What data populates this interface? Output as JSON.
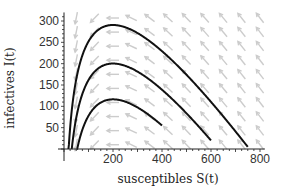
{
  "chart_data": {
    "type": "line",
    "title": "",
    "xlabel": "susceptibles S(t)",
    "ylabel": "infectives I(t)",
    "xlim": [
      0,
      820
    ],
    "ylim": [
      0,
      320
    ],
    "xticks": [
      200,
      400,
      600,
      800
    ],
    "yticks": [
      50,
      100,
      150,
      200,
      250,
      300
    ],
    "xtick_labels": [
      "200",
      "400",
      "600",
      "800"
    ],
    "ytick_labels": [
      "50",
      "100",
      "150",
      "200",
      "250",
      "300"
    ],
    "grid": false,
    "legend": "none",
    "model": {
      "rho": 200
    },
    "series": [
      {
        "name": "trajectory-1",
        "S0": 750,
        "I0": 5,
        "peak": {
          "S": 200,
          "I": 291
        }
      },
      {
        "name": "trajectory-2",
        "S0": 600,
        "I0": 20,
        "peak": {
          "S": 200,
          "I": 200
        }
      },
      {
        "name": "trajectory-3",
        "S0": 400,
        "I0": 55,
        "peak": {
          "S": 200,
          "I": 116
        }
      }
    ],
    "vector_field": {
      "description": "direction field arrows of SIR system",
      "color": "#c8c8c8"
    },
    "colors": {
      "curve": "#111111",
      "axis": "#222222",
      "arrows": "#cccccc"
    }
  }
}
